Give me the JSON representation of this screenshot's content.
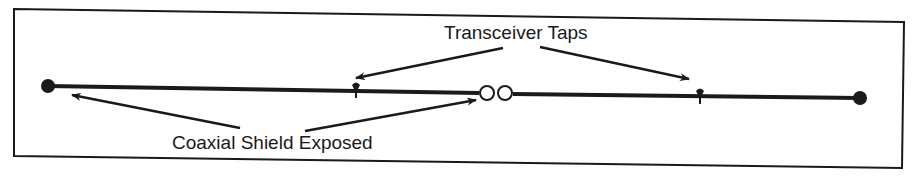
{
  "diagram": {
    "labels": {
      "taps": "Transceiver Taps",
      "shield": "Coaxial Shield Exposed"
    },
    "colors": {
      "ink": "#1a1a1a",
      "background": "#ffffff"
    },
    "elements": {
      "cable": "coaxial cable segment",
      "terminators": [
        "left terminator",
        "right terminator"
      ],
      "connector": "barrel connector (two open circles)",
      "taps": [
        "tap left",
        "tap right"
      ]
    }
  }
}
